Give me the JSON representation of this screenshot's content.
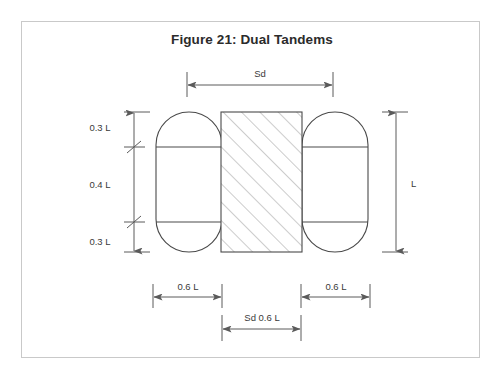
{
  "figure": {
    "title": "Figure 21: Dual Tandems",
    "border_color": "#c9c9c9",
    "line_color": "#5a5a5a",
    "shape_color": "#4a4a4a",
    "hatch_color": "#8a8a8a",
    "text_color": "#3a3a3a",
    "background": "#ffffff"
  },
  "dimensions": {
    "top": {
      "label": "Sd",
      "name": "dual-spacing"
    },
    "right": {
      "label": "L",
      "name": "overall-length"
    },
    "left": [
      {
        "label": "0.3 L",
        "name": "upper-segment"
      },
      {
        "label": "0.4 L",
        "name": "middle-segment"
      },
      {
        "label": "0.3 L",
        "name": "lower-segment"
      }
    ],
    "bottom": [
      {
        "label": "0.6 L",
        "name": "left-tire-width"
      },
      {
        "label": "0.6 L",
        "name": "right-tire-width"
      },
      {
        "label": "Sd 0.6 L",
        "name": "center-gap-width"
      }
    ]
  },
  "shapes": {
    "left_tire": "stadium-rounded-rectangle",
    "right_tire": "stadium-rounded-rectangle",
    "center_region": "hatched-rectangle"
  }
}
